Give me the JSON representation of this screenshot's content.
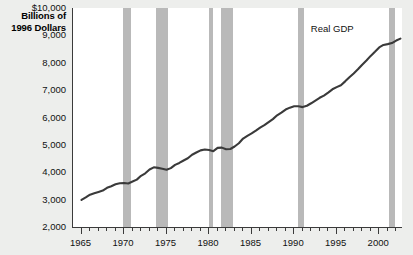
{
  "chart_data": {
    "type": "line",
    "title": "",
    "ylabel": "Billions of 1996 Dollars",
    "ylabel_lines": [
      "Billions of",
      "1996 Dollars"
    ],
    "xlabel": "",
    "xlim": [
      1964,
      2002.8
    ],
    "ylim": [
      2000,
      10000
    ],
    "grid": false,
    "legend_position": "inline-annotation",
    "yticks": [
      2000,
      3000,
      4000,
      5000,
      6000,
      7000,
      8000,
      9000,
      10000
    ],
    "ytick_labels": [
      "2,000",
      "3,000",
      "4,000",
      "5,000",
      "6,000",
      "7,000",
      "8,000",
      "9,000",
      "$10,000"
    ],
    "xticks_major": [
      1965,
      1970,
      1975,
      1980,
      1985,
      1990,
      1995,
      2000
    ],
    "xtick_labels": [
      "1965",
      "1970",
      "1975",
      "1980",
      "1985",
      "1990",
      "1995",
      "2000"
    ],
    "series": [
      {
        "name": "Real GDP",
        "color": "#3a3a3a",
        "x": [
          1965.0,
          1965.5,
          1966.0,
          1966.5,
          1967.0,
          1967.5,
          1968.0,
          1968.5,
          1969.0,
          1969.5,
          1970.0,
          1970.5,
          1971.0,
          1971.5,
          1972.0,
          1972.5,
          1973.0,
          1973.5,
          1974.0,
          1974.5,
          1975.0,
          1975.5,
          1976.0,
          1976.5,
          1977.0,
          1977.5,
          1978.0,
          1978.5,
          1979.0,
          1979.5,
          1980.0,
          1980.5,
          1981.0,
          1981.5,
          1982.0,
          1982.5,
          1983.0,
          1983.5,
          1984.0,
          1984.5,
          1985.0,
          1985.5,
          1986.0,
          1986.5,
          1987.0,
          1987.5,
          1988.0,
          1988.5,
          1989.0,
          1989.5,
          1990.0,
          1990.5,
          1991.0,
          1991.5,
          1992.0,
          1992.5,
          1993.0,
          1993.5,
          1994.0,
          1994.5,
          1995.0,
          1995.5,
          1996.0,
          1996.5,
          1997.0,
          1997.5,
          1998.0,
          1998.5,
          1999.0,
          1999.5,
          2000.0,
          2000.5,
          2001.0,
          2001.5,
          2002.0,
          2002.5
        ],
        "y": [
          2990,
          3080,
          3180,
          3230,
          3280,
          3330,
          3430,
          3490,
          3560,
          3600,
          3610,
          3590,
          3660,
          3730,
          3870,
          3960,
          4100,
          4180,
          4160,
          4130,
          4090,
          4150,
          4270,
          4340,
          4430,
          4510,
          4640,
          4720,
          4800,
          4830,
          4810,
          4770,
          4890,
          4900,
          4840,
          4850,
          4940,
          5060,
          5230,
          5330,
          5420,
          5520,
          5630,
          5720,
          5830,
          5940,
          6080,
          6180,
          6290,
          6360,
          6410,
          6410,
          6380,
          6430,
          6520,
          6620,
          6720,
          6800,
          6910,
          7030,
          7110,
          7180,
          7320,
          7470,
          7610,
          7760,
          7930,
          8080,
          8250,
          8400,
          8560,
          8650,
          8680,
          8720,
          8810,
          8880
        ]
      }
    ],
    "shaded_regions": {
      "name": "recessions",
      "color": "#b9b9b9",
      "spans": [
        {
          "start": 1969.9,
          "end": 1970.8
        },
        {
          "start": 1973.8,
          "end": 1975.2
        },
        {
          "start": 1980.0,
          "end": 1980.5
        },
        {
          "start": 1981.4,
          "end": 1982.8
        },
        {
          "start": 1990.5,
          "end": 1991.2
        },
        {
          "start": 2001.1,
          "end": 2001.9
        }
      ]
    },
    "annotations": [
      {
        "text": "Real GDP",
        "x": 1994.6,
        "y": 9250
      }
    ]
  }
}
